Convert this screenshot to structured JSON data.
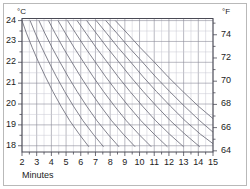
{
  "figure": {
    "border_color": "#b9b9b9",
    "background": "#ffffff"
  },
  "axes": {
    "left_unit": "°C",
    "right_unit": "°F",
    "xlabel": "Minutes",
    "celsius_ticks": [
      "24",
      "23",
      "22",
      "21",
      "20",
      "19",
      "18"
    ],
    "fahrenheit_ticks": [
      "74",
      "72",
      "70",
      "68",
      "66",
      "64"
    ],
    "minute_ticks": [
      "2",
      "3",
      "4",
      "5",
      "6",
      "7",
      "8",
      "9",
      "10",
      "11",
      "12",
      "13",
      "14",
      "15"
    ]
  },
  "chart_data": {
    "type": "line",
    "title": "",
    "subtitle": "",
    "xlabel": "Minutes",
    "ylabel": "°C",
    "y2label": "°F",
    "xlim": [
      2,
      15
    ],
    "ylim": [
      17.7,
      24.1
    ],
    "y2lim": [
      63.9,
      75.4
    ],
    "grid": true,
    "grid_color": "#8c8c99",
    "minor_grid_color": "#c8c8d2",
    "legend": "none",
    "line_color": "#6b6b78",
    "xticks": [
      2,
      3,
      4,
      5,
      6,
      7,
      8,
      9,
      10,
      11,
      12,
      13,
      14,
      15
    ],
    "yticks": [
      18,
      19,
      20,
      21,
      22,
      23,
      24
    ],
    "y2ticks": [
      64,
      66,
      68,
      70,
      72,
      74
    ],
    "annotation": "Family of cooling curves; each curve starts at 24 °C on the top axis at a different minute and descends to 18 °C.",
    "series": [
      {
        "name": "curve-1",
        "x": [
          2.0,
          2.3,
          2.7,
          3.1,
          3.6,
          4.1,
          4.65,
          5.25,
          5.9,
          6.55
        ],
        "y": [
          24.0,
          23.4,
          22.7,
          22.05,
          21.3,
          20.6,
          19.9,
          19.2,
          18.55,
          17.95
        ]
      },
      {
        "name": "curve-2",
        "x": [
          2.55,
          2.9,
          3.35,
          3.8,
          4.35,
          4.9,
          5.5,
          6.15,
          6.85,
          7.55
        ],
        "y": [
          24.0,
          23.4,
          22.7,
          22.05,
          21.3,
          20.6,
          19.9,
          19.2,
          18.55,
          17.95
        ]
      },
      {
        "name": "curve-3",
        "x": [
          3.15,
          3.55,
          4.05,
          4.55,
          5.15,
          5.75,
          6.4,
          7.1,
          7.85,
          8.6
        ],
        "y": [
          24.0,
          23.4,
          22.7,
          22.05,
          21.3,
          20.6,
          19.9,
          19.2,
          18.55,
          17.95
        ]
      },
      {
        "name": "curve-4",
        "x": [
          3.8,
          4.25,
          4.8,
          5.35,
          6.0,
          6.65,
          7.35,
          8.1,
          8.9,
          9.7
        ],
        "y": [
          24.0,
          23.4,
          22.7,
          22.05,
          21.3,
          20.6,
          19.9,
          19.2,
          18.55,
          17.95
        ]
      },
      {
        "name": "curve-5",
        "x": [
          4.45,
          4.95,
          5.55,
          6.15,
          6.85,
          7.55,
          8.3,
          9.1,
          9.95,
          10.8
        ],
        "y": [
          24.0,
          23.4,
          22.7,
          22.05,
          21.3,
          20.6,
          19.9,
          19.2,
          18.55,
          17.95
        ]
      },
      {
        "name": "curve-6",
        "x": [
          5.1,
          5.65,
          6.3,
          6.95,
          7.7,
          8.45,
          9.25,
          10.1,
          11.0,
          11.9
        ],
        "y": [
          24.0,
          23.4,
          22.7,
          22.05,
          21.3,
          20.6,
          19.9,
          19.2,
          18.55,
          17.95
        ]
      },
      {
        "name": "curve-7",
        "x": [
          5.75,
          6.35,
          7.05,
          7.75,
          8.55,
          9.35,
          10.2,
          11.1,
          12.05,
          13.0
        ],
        "y": [
          24.0,
          23.4,
          22.7,
          22.05,
          21.3,
          20.6,
          19.9,
          19.2,
          18.55,
          17.95
        ]
      },
      {
        "name": "curve-8",
        "x": [
          6.4,
          7.05,
          7.8,
          8.55,
          9.4,
          10.25,
          11.15,
          12.1,
          13.1,
          14.1
        ],
        "y": [
          24.0,
          23.4,
          22.7,
          22.05,
          21.3,
          20.6,
          19.9,
          19.2,
          18.55,
          17.95
        ]
      },
      {
        "name": "curve-9",
        "x": [
          7.05,
          7.75,
          8.55,
          9.35,
          10.25,
          11.15,
          12.1,
          13.1,
          14.15,
          15.0
        ],
        "y": [
          24.0,
          23.4,
          22.7,
          22.05,
          21.3,
          20.6,
          19.9,
          19.2,
          18.55,
          18.1
        ]
      },
      {
        "name": "curve-10",
        "x": [
          7.7,
          8.45,
          9.3,
          10.15,
          11.1,
          12.05,
          13.05,
          14.1,
          15.0
        ],
        "y": [
          24.0,
          23.4,
          22.7,
          22.05,
          21.3,
          20.6,
          19.9,
          19.2,
          18.65
        ]
      },
      {
        "name": "curve-11",
        "x": [
          8.35,
          9.15,
          10.05,
          10.95,
          11.95,
          12.95,
          14.0,
          15.0
        ],
        "y": [
          24.0,
          23.4,
          22.7,
          22.05,
          21.3,
          20.6,
          19.9,
          19.3
        ]
      }
    ]
  }
}
